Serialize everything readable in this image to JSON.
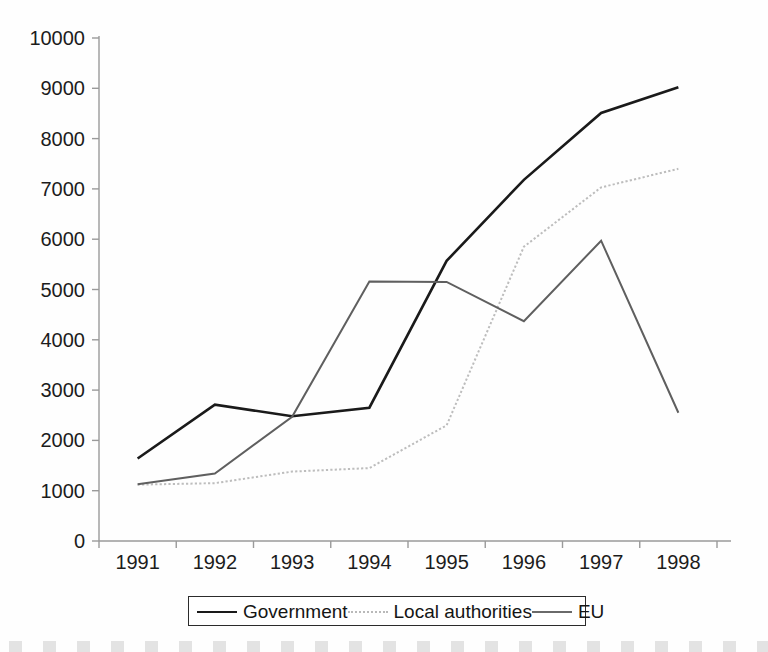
{
  "chart_data": {
    "type": "line",
    "title": "",
    "xlabel": "",
    "ylabel": "",
    "categories": [
      "1991",
      "1992",
      "1993",
      "1994",
      "1995",
      "1996",
      "1997",
      "1998"
    ],
    "x_tick_labels": [
      "1991",
      "1992",
      "1993",
      "1994",
      "1995",
      "1996",
      "1997",
      "1998"
    ],
    "y_tick_labels": [
      "0",
      "1000",
      "2000",
      "3000",
      "4000",
      "5000",
      "6000",
      "7000",
      "8000",
      "9000",
      "10000"
    ],
    "y_ticks": [
      0,
      1000,
      2000,
      3000,
      4000,
      5000,
      6000,
      7000,
      8000,
      9000,
      10000
    ],
    "ylim": [
      0,
      10000
    ],
    "grid": false,
    "legend_position": "bottom",
    "series": [
      {
        "name": "Government",
        "color": "#1a1a1a",
        "style": "solid",
        "width": 2.6,
        "values": [
          1640,
          2710,
          2480,
          2650,
          5570,
          7180,
          8510,
          9020
        ]
      },
      {
        "name": "Local authorities",
        "color": "#bdbdbd",
        "style": "dotted",
        "width": 2.0,
        "values": [
          1120,
          1150,
          1380,
          1450,
          2300,
          5850,
          7030,
          7400
        ]
      },
      {
        "name": "EU",
        "color": "#5f5f5f",
        "style": "solid",
        "width": 2.0,
        "values": [
          1130,
          1340,
          2470,
          5160,
          5150,
          4370,
          5970,
          2550
        ]
      }
    ]
  },
  "legend": {
    "entries": [
      {
        "label": "Government",
        "swatch": "line-solid-dark-swatch"
      },
      {
        "label": "Local authorities",
        "swatch": "line-dotted-light-swatch"
      },
      {
        "label": "EU",
        "swatch": "line-solid-gray-swatch"
      }
    ]
  },
  "axes": {
    "axis_color": "#9a9a9a",
    "tick_color": "#9a9a9a",
    "label_color": "#1c1c1c"
  }
}
